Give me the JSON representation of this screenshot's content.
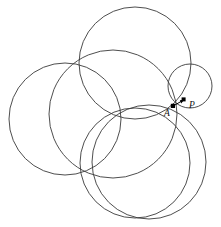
{
  "figure": {
    "background_color": "#ffffff",
    "stroke_color": "#3a3a3a",
    "label_color": "#111111",
    "width": 221,
    "height": 227,
    "circles": [
      {
        "name": "central-circle",
        "cx": 113,
        "cy": 114,
        "r": 64
      },
      {
        "name": "left-circle",
        "cx": 65,
        "cy": 119,
        "r": 56
      },
      {
        "name": "top-circle",
        "cx": 135,
        "cy": 63,
        "r": 56
      },
      {
        "name": "bottom-circle",
        "cx": 135,
        "cy": 163,
        "r": 55
      },
      {
        "name": "bottom-right-circle",
        "cx": 149,
        "cy": 162,
        "r": 57
      },
      {
        "name": "small-right-circle",
        "cx": 190,
        "cy": 86,
        "r": 22
      }
    ],
    "points": [
      {
        "name": "point-a",
        "label": "A",
        "x": 173,
        "y": 106,
        "label_x": 166,
        "label_y": 115
      },
      {
        "name": "point-p",
        "label": "P",
        "x": 184,
        "y": 100,
        "label_x": 189,
        "label_y": 108
      }
    ],
    "arrow": {
      "name": "arrow-a-to-p",
      "from_x": 173,
      "from_y": 106,
      "to_x": 184,
      "to_y": 100,
      "description": "arrow from A to P"
    }
  }
}
